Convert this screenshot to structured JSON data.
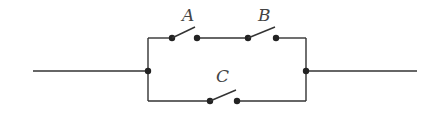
{
  "diagram": {
    "type": "circuit",
    "colors": {
      "wire": "#333333",
      "node": "#222222",
      "label": "#444444"
    },
    "switches": [
      {
        "id": "A",
        "label": "A",
        "branch": "top",
        "state": "open"
      },
      {
        "id": "B",
        "label": "B",
        "branch": "top",
        "state": "open"
      },
      {
        "id": "C",
        "label": "C",
        "branch": "bottom",
        "state": "open"
      }
    ],
    "branches": [
      {
        "name": "top",
        "components": [
          "A",
          "B"
        ],
        "connection": "series"
      },
      {
        "name": "bottom",
        "components": [
          "C"
        ],
        "connection": "single"
      }
    ],
    "topology": "(A series B) parallel C"
  }
}
